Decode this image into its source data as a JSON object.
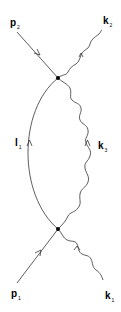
{
  "diagram": {
    "type": "feynman-diagram",
    "vertices": [
      {
        "id": "top",
        "x": 58,
        "y": 78
      },
      {
        "id": "bottom",
        "x": 58,
        "y": 229
      }
    ],
    "labels": {
      "p2": {
        "main": "p",
        "sub": "2"
      },
      "k2": {
        "main": "k",
        "sub": "2"
      },
      "l1": {
        "main": "l",
        "sub": "1"
      },
      "k3": {
        "main": "k",
        "sub": "3"
      },
      "p1": {
        "main": "p",
        "sub": "1"
      },
      "k1": {
        "main": "k",
        "sub": "1"
      }
    },
    "lines": [
      {
        "name": "p1",
        "kind": "fermion",
        "from": "external",
        "to": "bottom"
      },
      {
        "name": "k1",
        "kind": "photon",
        "from": "external",
        "to": "bottom"
      },
      {
        "name": "l1",
        "kind": "fermion-propagator",
        "from": "bottom",
        "to": "top"
      },
      {
        "name": "k3",
        "kind": "photon-propagator",
        "from": "bottom",
        "to": "top"
      },
      {
        "name": "p2",
        "kind": "fermion",
        "from": "top",
        "to": "external"
      },
      {
        "name": "k2",
        "kind": "photon",
        "from": "top",
        "to": "external"
      }
    ],
    "colors": {
      "line": "#333333",
      "vertex": "#000000",
      "background": "#ffffff"
    }
  }
}
